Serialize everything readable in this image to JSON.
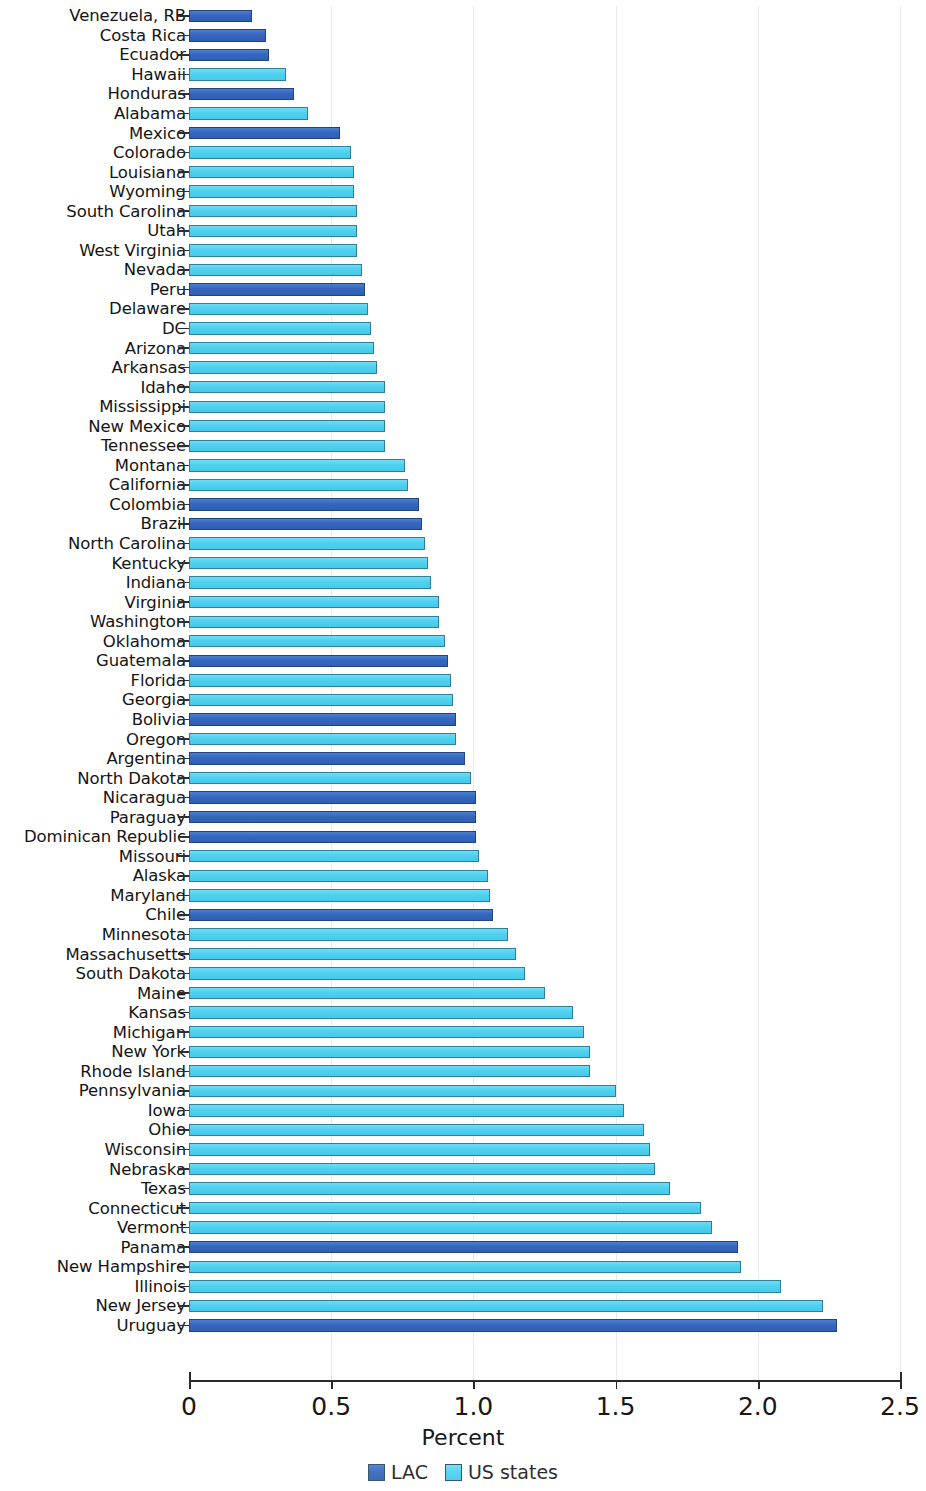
{
  "chart_data": {
    "type": "bar",
    "orientation": "horizontal",
    "title": "",
    "xlabel": "Percent",
    "ylabel": "",
    "xlim": [
      0,
      2.5
    ],
    "xticks": [
      "0",
      "0.5",
      "1.0",
      "1.5",
      "2.0",
      "2.5"
    ],
    "xtick_values": [
      0,
      0.5,
      1.0,
      1.5,
      2.0,
      2.5
    ],
    "grid": true,
    "legend_position": "bottom",
    "series": [
      {
        "name": "LAC",
        "color": "#3566bd"
      },
      {
        "name": "US states",
        "color": "#4fd0ef"
      }
    ],
    "categories": [
      "Venezuela, RB",
      "Costa Rica",
      "Ecuador",
      "Hawaii",
      "Honduras",
      "Alabama",
      "Mexico",
      "Colorado",
      "Louisiana",
      "Wyoming",
      "South Carolina",
      "Utah",
      "West Virginia",
      "Nevada",
      "Peru",
      "Delaware",
      "DC",
      "Arizona",
      "Arkansas",
      "Idaho",
      "Mississippi",
      "New Mexico",
      "Tennessee",
      "Montana",
      "California",
      "Colombia",
      "Brazil",
      "North Carolina",
      "Kentucky",
      "Indiana",
      "Virginia",
      "Washington",
      "Oklahoma",
      "Guatemala",
      "Florida",
      "Georgia",
      "Bolivia",
      "Oregon",
      "Argentina",
      "North Dakota",
      "Nicaragua",
      "Paraguay",
      "Dominican Republic",
      "Missouri",
      "Alaska",
      "Maryland",
      "Chile",
      "Minnesota",
      "Massachusetts",
      "South Dakota",
      "Maine",
      "Kansas",
      "Michigan",
      "New York",
      "Rhode Island",
      "Pennsylvania",
      "Iowa",
      "Ohio",
      "Wisconsin",
      "Nebraska",
      "Texas",
      "Connecticut",
      "Vermont",
      "Panama",
      "New Hampshire",
      "Illinois",
      "New Jersey",
      "Uruguay"
    ],
    "values": [
      0.22,
      0.27,
      0.28,
      0.34,
      0.37,
      0.42,
      0.53,
      0.57,
      0.58,
      0.58,
      0.59,
      0.59,
      0.59,
      0.61,
      0.62,
      0.63,
      0.64,
      0.65,
      0.66,
      0.69,
      0.69,
      0.69,
      0.69,
      0.76,
      0.77,
      0.81,
      0.82,
      0.83,
      0.84,
      0.85,
      0.88,
      0.88,
      0.9,
      0.91,
      0.92,
      0.93,
      0.94,
      0.94,
      0.97,
      0.99,
      1.01,
      1.01,
      1.01,
      1.02,
      1.05,
      1.06,
      1.07,
      1.12,
      1.15,
      1.18,
      1.25,
      1.35,
      1.39,
      1.41,
      1.41,
      1.5,
      1.53,
      1.6,
      1.62,
      1.64,
      1.69,
      1.8,
      1.84,
      1.93,
      1.94,
      2.08,
      2.23,
      2.28
    ],
    "groups": [
      "LAC",
      "LAC",
      "LAC",
      "US states",
      "LAC",
      "US states",
      "LAC",
      "US states",
      "US states",
      "US states",
      "US states",
      "US states",
      "US states",
      "US states",
      "LAC",
      "US states",
      "US states",
      "US states",
      "US states",
      "US states",
      "US states",
      "US states",
      "US states",
      "US states",
      "US states",
      "LAC",
      "LAC",
      "US states",
      "US states",
      "US states",
      "US states",
      "US states",
      "US states",
      "LAC",
      "US states",
      "US states",
      "LAC",
      "US states",
      "LAC",
      "US states",
      "LAC",
      "LAC",
      "LAC",
      "US states",
      "US states",
      "US states",
      "LAC",
      "US states",
      "US states",
      "US states",
      "US states",
      "US states",
      "US states",
      "US states",
      "US states",
      "US states",
      "US states",
      "US states",
      "US states",
      "US states",
      "US states",
      "US states",
      "US states",
      "LAC",
      "US states",
      "US states",
      "US states",
      "LAC"
    ]
  },
  "axis": {
    "x_title": "Percent",
    "tick_labels": [
      "0",
      "0.5",
      "1.0",
      "1.5",
      "2.0",
      "2.5"
    ]
  },
  "legend": {
    "items": [
      {
        "label": "LAC"
      },
      {
        "label": "US states"
      }
    ]
  }
}
